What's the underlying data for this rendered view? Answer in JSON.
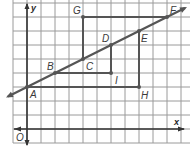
{
  "diagram": {
    "type": "coordinate-grid",
    "grid": {
      "x_range": [
        -1,
        11
      ],
      "y_range": [
        -1,
        9
      ],
      "step": 1
    },
    "axes": {
      "x_label": "x",
      "y_label": "y",
      "origin_label": "O"
    },
    "colors": {
      "grid": "#9a9a9a",
      "axis": "#333333",
      "line": "#555555",
      "background": "#ffffff"
    },
    "line": {
      "through": [
        "A",
        "B",
        "C",
        "D",
        "E",
        "F"
      ],
      "slope": 0.5,
      "intercept": 3,
      "x_from": -1,
      "x_to": 11
    },
    "points": [
      {
        "name": "A",
        "x": 0,
        "y": 3
      },
      {
        "name": "B",
        "x": 2,
        "y": 4
      },
      {
        "name": "C",
        "x": 4,
        "y": 5
      },
      {
        "name": "D",
        "x": 6,
        "y": 6
      },
      {
        "name": "E",
        "x": 8,
        "y": 7
      },
      {
        "name": "F",
        "x": 10,
        "y": 8
      },
      {
        "name": "G",
        "x": 4,
        "y": 8
      },
      {
        "name": "H",
        "x": 8,
        "y": 3
      },
      {
        "name": "I",
        "x": 6,
        "y": 4
      }
    ],
    "segments": [
      {
        "from": "G",
        "to": "F"
      },
      {
        "from": "G",
        "to": "C"
      },
      {
        "from": "B",
        "to": "I"
      },
      {
        "from": "D",
        "to": "I"
      },
      {
        "from": "A",
        "to": "H"
      },
      {
        "from": "E",
        "to": "H"
      }
    ]
  }
}
